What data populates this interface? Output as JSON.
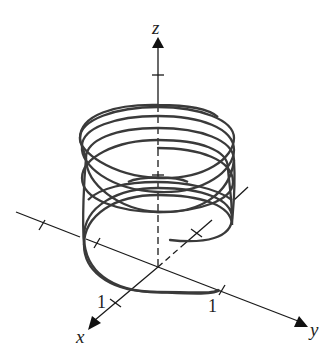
{
  "figure": {
    "axes": {
      "x": {
        "label": "x",
        "tick_label": "1"
      },
      "y": {
        "label": "y",
        "tick_label": "1"
      },
      "z": {
        "label": "z"
      }
    },
    "curve": {
      "type": "helix",
      "turns_visible": 5,
      "color": "#333333"
    },
    "colors": {
      "axis": "#1a1a1a",
      "curve": "#3a3a3a",
      "background": "#ffffff"
    }
  }
}
